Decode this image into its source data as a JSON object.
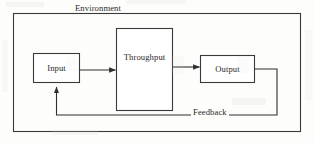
{
  "diagram": {
    "title": "Environment",
    "type": "systems-input-throughput-output-feedback",
    "outer_boundary": {
      "label": "Environment",
      "stroke": "#3a3a3a"
    },
    "nodes": [
      {
        "id": "input",
        "label": "Input"
      },
      {
        "id": "throughput",
        "label": "Throughput"
      },
      {
        "id": "output",
        "label": "Output"
      }
    ],
    "edges": [
      {
        "id": "input-to-throughput",
        "from": "input",
        "to": "throughput",
        "label": ""
      },
      {
        "id": "throughput-to-output",
        "from": "throughput",
        "to": "output",
        "label": ""
      },
      {
        "id": "output-to-input",
        "from": "output",
        "to": "input",
        "label": "Feedback"
      }
    ],
    "colors": {
      "stroke": "#3a3a3a",
      "box_fill": "#ffffff",
      "text": "#2a2a2a",
      "page": "#fdfdfc"
    }
  }
}
